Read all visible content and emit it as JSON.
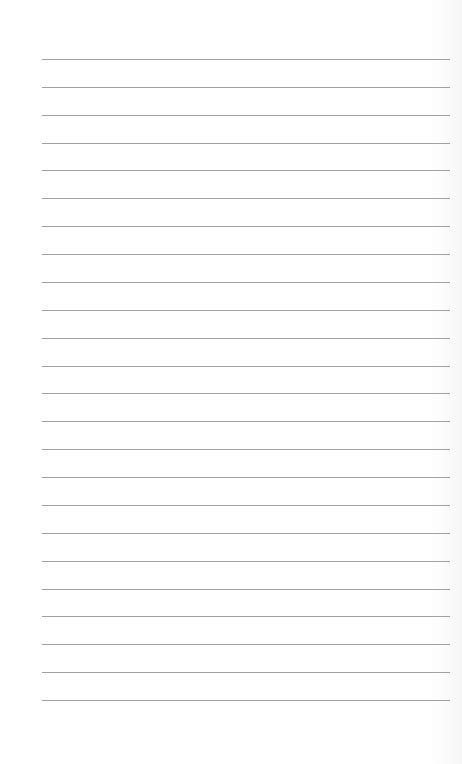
{
  "page": {
    "type": "lined-paper",
    "background_color": "#ffffff",
    "line_color": "#a0a0a0",
    "line_count": 24,
    "first_line_y": 59,
    "line_spacing": 27.87,
    "line_left": 42,
    "line_right": 450
  }
}
